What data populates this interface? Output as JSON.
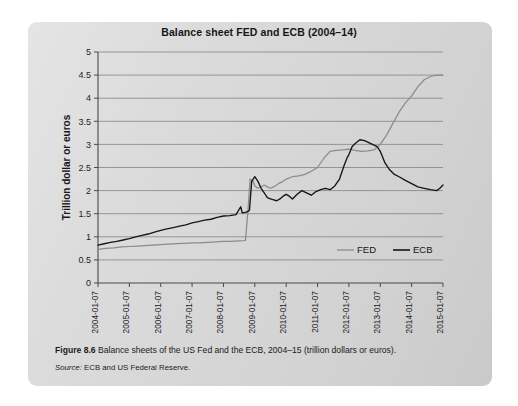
{
  "figure": {
    "caption_number": "Figure 8.6",
    "caption_text": "Balance sheets of the US Fed and the ECB, 2004–15 (trillion dollars or euros).",
    "source_label": "Source:",
    "source_text": "ECB and US Federal Reserve."
  },
  "chart_data": {
    "type": "line",
    "title": "Balance sheet FED and ECB (2004–14)",
    "xlabel": "",
    "ylabel": "Trillion dollar or euros",
    "ylim": [
      0,
      5
    ],
    "ytick_labels": [
      "5",
      "4.5",
      "4",
      "3.5",
      "3",
      "2.5",
      "2",
      "1.5",
      "1",
      "0.5",
      "0"
    ],
    "ytick_values": [
      5,
      4.5,
      4,
      3.5,
      3,
      2.5,
      2,
      1.5,
      1,
      0.5,
      0
    ],
    "grid": true,
    "legend_position": "inside-bottom-right",
    "categories": [
      "2004-01-07",
      "2005-01-07",
      "2006-01-07",
      "2007-01-07",
      "2008-01-07",
      "2009-01-07",
      "2010-01-07",
      "2011-01-07",
      "2012-01-07",
      "2013-01-07",
      "2014-01-07",
      "2015-01-07"
    ],
    "x_axis_units": "years (tick every 12 months)",
    "series": [
      {
        "name": "FED",
        "color": "#8b8b8b",
        "x": [
          2004.0,
          2004.25,
          2004.5,
          2004.75,
          2005.0,
          2005.25,
          2005.5,
          2005.75,
          2006.0,
          2006.25,
          2006.5,
          2006.75,
          2007.0,
          2007.25,
          2007.5,
          2007.75,
          2008.0,
          2008.25,
          2008.5,
          2008.7,
          2008.78,
          2008.85,
          2008.95,
          2009.0,
          2009.1,
          2009.2,
          2009.3,
          2009.4,
          2009.5,
          2009.6,
          2009.75,
          2009.9,
          2010.0,
          2010.2,
          2010.4,
          2010.6,
          2010.8,
          2011.0,
          2011.2,
          2011.4,
          2011.6,
          2011.8,
          2012.0,
          2012.2,
          2012.4,
          2012.6,
          2012.8,
          2013.0,
          2013.2,
          2013.4,
          2013.6,
          2013.8,
          2014.0,
          2014.2,
          2014.4,
          2014.6,
          2014.8,
          2015.0
        ],
        "values": [
          0.73,
          0.75,
          0.76,
          0.78,
          0.79,
          0.8,
          0.81,
          0.82,
          0.83,
          0.84,
          0.85,
          0.86,
          0.87,
          0.87,
          0.88,
          0.89,
          0.9,
          0.9,
          0.91,
          0.92,
          1.55,
          2.25,
          2.2,
          2.1,
          2.05,
          2.08,
          2.12,
          2.08,
          2.05,
          2.08,
          2.15,
          2.2,
          2.25,
          2.3,
          2.32,
          2.35,
          2.42,
          2.5,
          2.7,
          2.85,
          2.87,
          2.88,
          2.9,
          2.87,
          2.85,
          2.86,
          2.88,
          3.0,
          3.2,
          3.45,
          3.7,
          3.9,
          4.05,
          4.25,
          4.4,
          4.47,
          4.5,
          4.5
        ]
      },
      {
        "name": "ECB",
        "color": "#151515",
        "x": [
          2004.0,
          2004.2,
          2004.4,
          2004.6,
          2004.8,
          2005.0,
          2005.2,
          2005.4,
          2005.6,
          2005.8,
          2006.0,
          2006.2,
          2006.4,
          2006.6,
          2006.8,
          2007.0,
          2007.2,
          2007.4,
          2007.6,
          2007.8,
          2008.0,
          2008.2,
          2008.4,
          2008.55,
          2008.6,
          2008.7,
          2008.78,
          2008.83,
          2008.9,
          2009.0,
          2009.1,
          2009.2,
          2009.3,
          2009.4,
          2009.5,
          2009.6,
          2009.7,
          2009.8,
          2009.9,
          2010.0,
          2010.1,
          2010.2,
          2010.35,
          2010.5,
          2010.65,
          2010.8,
          2010.95,
          2011.1,
          2011.25,
          2011.4,
          2011.55,
          2011.7,
          2011.85,
          2011.95,
          2012.0,
          2012.1,
          2012.2,
          2012.35,
          2012.5,
          2012.6,
          2012.75,
          2012.9,
          2013.0,
          2013.15,
          2013.3,
          2013.45,
          2013.6,
          2013.8,
          2014.0,
          2014.2,
          2014.4,
          2014.6,
          2014.8,
          2014.9,
          2015.0
        ],
        "values": [
          0.82,
          0.85,
          0.88,
          0.9,
          0.93,
          0.96,
          1.0,
          1.03,
          1.06,
          1.1,
          1.14,
          1.17,
          1.2,
          1.23,
          1.26,
          1.3,
          1.33,
          1.36,
          1.38,
          1.42,
          1.45,
          1.46,
          1.48,
          1.65,
          1.52,
          1.53,
          1.55,
          1.58,
          2.2,
          2.3,
          2.2,
          2.05,
          1.95,
          1.85,
          1.82,
          1.8,
          1.78,
          1.82,
          1.88,
          1.92,
          1.88,
          1.82,
          1.92,
          2.0,
          1.95,
          1.9,
          1.98,
          2.02,
          2.05,
          2.02,
          2.1,
          2.25,
          2.55,
          2.72,
          2.78,
          2.95,
          3.02,
          3.1,
          3.08,
          3.05,
          3.0,
          2.95,
          2.85,
          2.6,
          2.45,
          2.35,
          2.3,
          2.22,
          2.15,
          2.08,
          2.05,
          2.02,
          2.0,
          2.05,
          2.12
        ]
      }
    ]
  },
  "legend": {
    "items": [
      {
        "label": "FED",
        "color": "#8b8b8b"
      },
      {
        "label": "ECB",
        "color": "#151515"
      }
    ]
  }
}
